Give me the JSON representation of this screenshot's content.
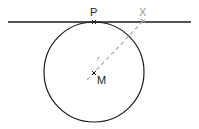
{
  "diagram": {
    "type": "geometry",
    "labels": {
      "point_p": "P",
      "point_x": "X",
      "center_m": "M",
      "radius": "r"
    },
    "colors": {
      "stroke": "#1a1a1a",
      "dashed": "#aaaaaa",
      "label_x": "#999999",
      "label_dark": "#222222"
    }
  }
}
